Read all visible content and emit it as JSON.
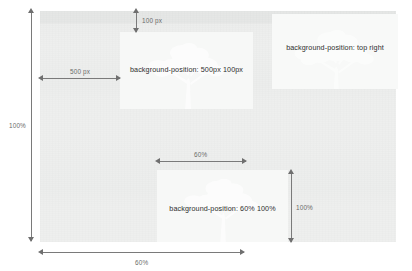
{
  "diagram": {
    "canvas": {
      "name": "element-box",
      "background_color": "#eeefee",
      "overlay_color": "#f7f8f7"
    },
    "boxes": [
      {
        "id": "box-500-100",
        "label": "background-position: 500px 100px"
      },
      {
        "id": "box-top-right",
        "label": "background-position: top right"
      },
      {
        "id": "box-60-100",
        "label": "background-position: 60% 100%"
      }
    ],
    "measures": {
      "top_offset": "100 px",
      "left_offset": "500 px",
      "element_height": "100%",
      "element_width_pct": "60%",
      "box_offset_x_pct": "60%",
      "box_offset_y_pct": "100%"
    },
    "colors": {
      "arrow": "#6f6f6f",
      "label_text": "#6b6b6b",
      "box_text": "#2e2e2e",
      "tree_silhouette": "#fdfdfd"
    }
  }
}
